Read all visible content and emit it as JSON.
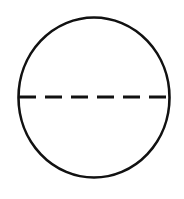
{
  "diagram": {
    "shape": "circle",
    "stroke_color": "#111111",
    "background": "#ffffff",
    "circle": {
      "cx": 94,
      "cy": 97.5,
      "rx": 75.5,
      "ry": 80
    },
    "divider": {
      "style": "dashed",
      "orientation": "horizontal",
      "y": 97
    }
  }
}
